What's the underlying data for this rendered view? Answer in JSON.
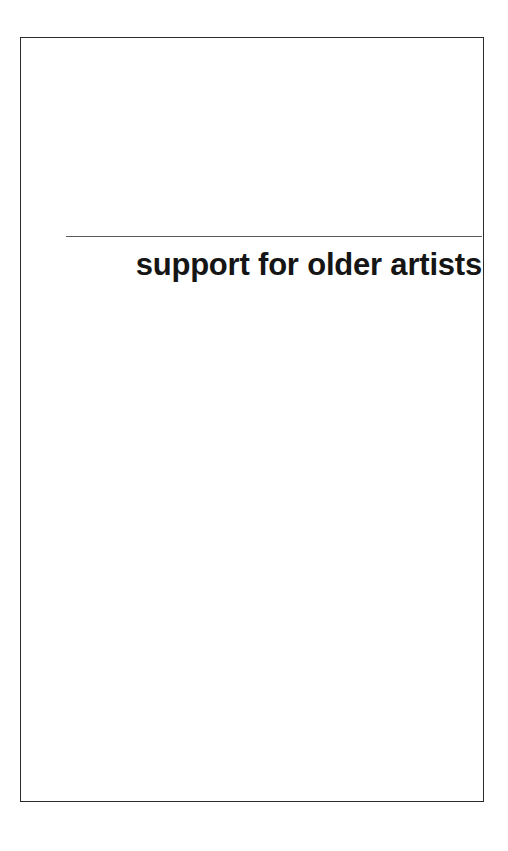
{
  "document": {
    "page_background": "#ffffff",
    "frame": {
      "border_color": "#2b2b2b",
      "fill_color": "#ffffff"
    },
    "header": {
      "rule_color": "#5a5a5a",
      "heading": "support for older artists",
      "heading_color": "#151515",
      "heading_alignment": "right"
    },
    "body": {
      "content": ""
    }
  }
}
